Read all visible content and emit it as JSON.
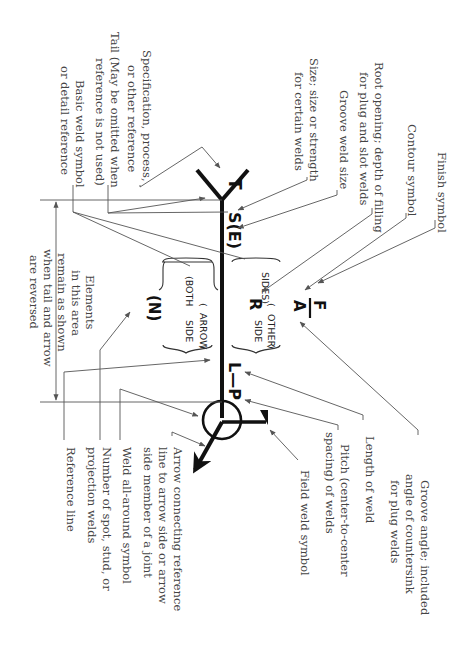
{
  "diagram": {
    "orientation": "rotated 90 degrees clockwise",
    "symbols": {
      "tail_text": "T",
      "size_text": "S(E)",
      "root_text": "R",
      "finish": "F",
      "angle": "A",
      "length_pitch": "L—P",
      "number": "(N)",
      "both": "(BOTH",
      "sides": "SIDES)",
      "arrow_side_1": "ARROW",
      "arrow_side_2": "SIDE",
      "other_side_1": "OTHER",
      "other_side_2": "SIDE"
    },
    "labels": {
      "finish_symbol": [
        "Finish symbol"
      ],
      "contour_symbol": [
        "Contour symbol"
      ],
      "root_opening": [
        "Root opening; depth of filling",
        "for plug and slot welds"
      ],
      "groove_weld_size": [
        "Groove weld size"
      ],
      "size": [
        "Size; size or strength",
        "for certain welds"
      ],
      "specification": [
        "Specification, process,",
        "or other reference"
      ],
      "tail": [
        "Tail (May be omitted when",
        "reference is not used)"
      ],
      "basic_weld_symbol": [
        "Basic weld symbol",
        "or detail reference"
      ],
      "elements_area": [
        "Elements",
        "in this area",
        "remain as shown",
        "when tail and arrow",
        "are reversed"
      ],
      "groove_angle": [
        "Groove angle; included",
        "angle of countersink",
        "for plug welds"
      ],
      "length_of_weld": [
        "Length of weld"
      ],
      "pitch": [
        "Pitch (center-to-center",
        "spacing) of welds"
      ],
      "field_weld": [
        "Field weld symbol"
      ],
      "arrow_connecting": [
        "Arrow connecting reference",
        "line to arrow side or arrow",
        "side member of a joint"
      ],
      "weld_all_around": [
        "Weld all-around symbol"
      ],
      "number_of_spot": [
        "Number of spot, stud, or",
        "projection welds"
      ],
      "reference_line": [
        "Reference line"
      ]
    }
  }
}
